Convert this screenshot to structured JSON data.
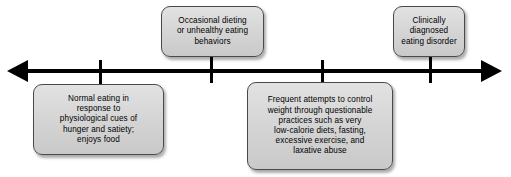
{
  "diagram": {
    "type": "continuum-spectrum",
    "axis": {
      "name": "eating-behavior-continuum-axis",
      "left_arrow": "left-arrow",
      "right_arrow": "right-arrow",
      "tick_count": 4
    },
    "nodes": [
      {
        "id": "normal-eating",
        "position": "below-left",
        "text": "Normal eating in\nresponse to\nphysiological cues of\nhunger and satiety;\nenjoys food",
        "lines": [
          "Normal eating in",
          "response to",
          "physiological cues of",
          "hunger and satiety;",
          "enjoys food"
        ]
      },
      {
        "id": "occasional-dieting",
        "position": "above-left-center",
        "text": "Occasional dieting\nor unhealthy eating\nbehaviors",
        "lines": [
          "Occasional dieting",
          "or unhealthy eating",
          "behaviors"
        ]
      },
      {
        "id": "frequent-attempts",
        "position": "below-right-center",
        "text": "Frequent attempts to control\nweight through questionable\npractices such as very\nlow-calorie diets, fasting,\nexcessive exercise, and\nlaxative abuse",
        "lines": [
          "Frequent attempts to control",
          "weight through questionable",
          "practices such as very",
          "low-calorie diets, fasting,",
          "excessive exercise, and",
          "laxative abuse"
        ]
      },
      {
        "id": "clinical-eating-disorder",
        "position": "above-right",
        "text": "Clinically\ndiagnosed\neating disorder",
        "lines": [
          "Clinically",
          "diagnosed",
          "eating disorder"
        ]
      }
    ],
    "colors": {
      "axis": "#000000",
      "box_fill": "#d6d6d6",
      "box_border": "#4a4a4a",
      "text": "#000000",
      "background": "#ffffff"
    }
  }
}
